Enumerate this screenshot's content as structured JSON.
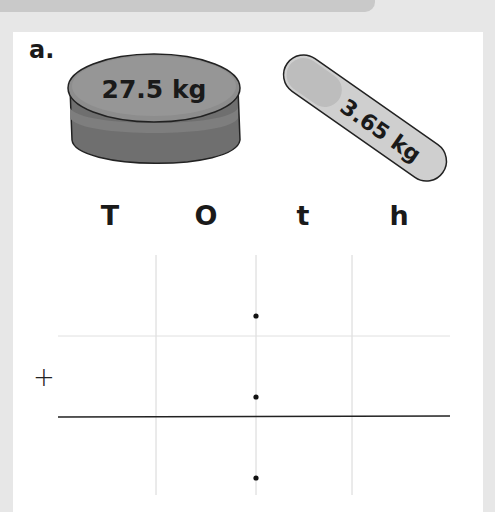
{
  "exercise": {
    "label": "a.",
    "items": [
      {
        "name": "round-container",
        "weight_label": "27.5 kg"
      },
      {
        "name": "tube",
        "weight_label": "3.65 kg"
      }
    ]
  },
  "place_value_grid": {
    "columns": [
      "T",
      "O",
      "t",
      "h"
    ],
    "operator": "+",
    "decimal_points": 3
  },
  "colors": {
    "background": "#e7e7e7",
    "banner": "#c9c9c9",
    "card": "#ffffff",
    "container_lid": "#8d8d8d",
    "container_body": "#6f6f6f",
    "tube": "#cfcfcf",
    "grid_line": "#d6d6d6",
    "answer_line": "#222222"
  }
}
